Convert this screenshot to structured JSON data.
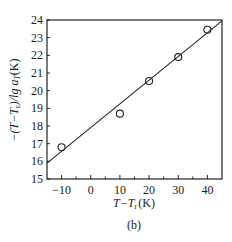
{
  "chart_data": {
    "type": "scatter",
    "title": "",
    "caption": "(b)",
    "xlabel": "T−T",
    "xlabel_sub": "r",
    "xlabel_unit": "(K)",
    "ylabel": "−(T−T",
    "ylabel_sub": "r",
    "ylabel_mid": ")/lg a",
    "ylabel_sub2": "T",
    "ylabel_unit": "(K)",
    "xlim": [
      -15,
      45
    ],
    "ylim": [
      15,
      24
    ],
    "xticks": [
      -10,
      0,
      10,
      20,
      30,
      40
    ],
    "xminor_step": 5,
    "yticks": [
      15,
      16,
      17,
      18,
      19,
      20,
      21,
      22,
      23,
      24
    ],
    "grid": false,
    "series": [
      {
        "name": "data",
        "marker": "open-circle",
        "x": [
          -10,
          10,
          20,
          30,
          40
        ],
        "y": [
          16.8,
          18.7,
          20.55,
          21.9,
          23.45
        ]
      },
      {
        "name": "linear fit",
        "style": "line",
        "x": [
          -15,
          45
        ],
        "y": [
          15.9,
          23.95
        ]
      }
    ]
  }
}
